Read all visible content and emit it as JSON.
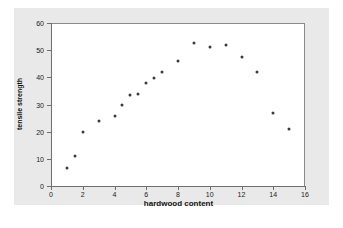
{
  "chart_data": {
    "type": "scatter",
    "title": "",
    "xlabel": "hardwood content",
    "ylabel": "tensile strength",
    "xlim": [
      0,
      16
    ],
    "ylim": [
      0,
      60
    ],
    "xticks": [
      0,
      2,
      4,
      6,
      8,
      10,
      12,
      14,
      16
    ],
    "yticks": [
      0,
      10,
      20,
      30,
      40,
      50,
      60
    ],
    "grid": false,
    "legend": null,
    "marker": "filled-circle",
    "marker_color": "#3a3a45",
    "points": [
      {
        "x": 1.0,
        "y": 6.5
      },
      {
        "x": 1.5,
        "y": 11.0
      },
      {
        "x": 2.0,
        "y": 19.8
      },
      {
        "x": 3.0,
        "y": 23.9
      },
      {
        "x": 4.0,
        "y": 25.8
      },
      {
        "x": 4.5,
        "y": 29.8
      },
      {
        "x": 5.0,
        "y": 33.6
      },
      {
        "x": 5.5,
        "y": 33.8
      },
      {
        "x": 6.0,
        "y": 38.0
      },
      {
        "x": 6.5,
        "y": 39.6
      },
      {
        "x": 7.0,
        "y": 41.8
      },
      {
        "x": 8.0,
        "y": 45.9
      },
      {
        "x": 9.0,
        "y": 52.7
      },
      {
        "x": 10.0,
        "y": 51.3
      },
      {
        "x": 11.0,
        "y": 52.0
      },
      {
        "x": 12.0,
        "y": 47.5
      },
      {
        "x": 13.0,
        "y": 42.0
      },
      {
        "x": 14.0,
        "y": 26.9
      },
      {
        "x": 15.0,
        "y": 21.1
      }
    ]
  },
  "colors": {
    "panel_background": "#e9e9e9",
    "plot_background": "#ffffff",
    "axis": "#6f6f6f",
    "marker": "#3a3a45",
    "text": "#111111"
  }
}
